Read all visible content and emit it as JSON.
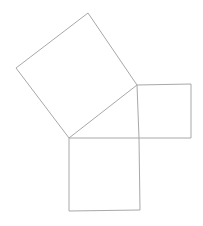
{
  "diagram": {
    "canvas": {
      "width": 203,
      "height": 226
    },
    "background_color": "#ffffff",
    "stroke_color": "#a8a8a8",
    "stroke_width": 1,
    "shapes": [
      {
        "name": "hypotenuse-square",
        "role": "square on the hypotenuse (tilted, upper-left)",
        "points": [
          [
            69,
            138
          ],
          [
            16,
            68
          ],
          [
            88,
            13
          ],
          [
            137,
            85
          ]
        ]
      },
      {
        "name": "vertical-leg-square",
        "role": "square on the vertical leg (right side)",
        "points": [
          [
            137,
            85
          ],
          [
            191,
            84
          ],
          [
            191,
            138
          ],
          [
            139,
            138
          ]
        ]
      },
      {
        "name": "horizontal-leg-square",
        "role": "square on the horizontal leg (bottom)",
        "points": [
          [
            69,
            138
          ],
          [
            139,
            138
          ],
          [
            140,
            210
          ],
          [
            69,
            211
          ]
        ]
      }
    ]
  }
}
